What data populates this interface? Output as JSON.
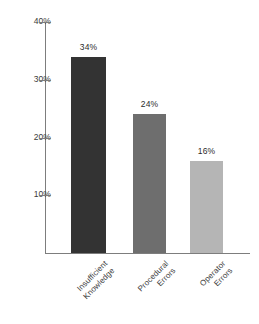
{
  "chart_data": {
    "type": "bar",
    "title": "",
    "subtitle": "",
    "xlabel": "",
    "ylabel": "",
    "categories": [
      "Insufficient\nKnowledge",
      "Procedural\nErrors",
      "Operator\nErrors"
    ],
    "values": [
      34,
      24,
      16
    ],
    "value_labels": [
      "34%",
      "24%",
      "16%"
    ],
    "bar_colors": [
      "#333333",
      "#6e6e6e",
      "#b5b5b5"
    ],
    "ylim": [
      0,
      40
    ],
    "yticks": [
      40,
      30,
      20,
      10
    ],
    "ytick_labels": [
      "40%",
      "30%",
      "20%",
      "10%"
    ],
    "grid": false,
    "legend": false,
    "background_color": "#ffffff",
    "axis_color": "#7d7d7d",
    "text_color": "#3b3b3b"
  }
}
